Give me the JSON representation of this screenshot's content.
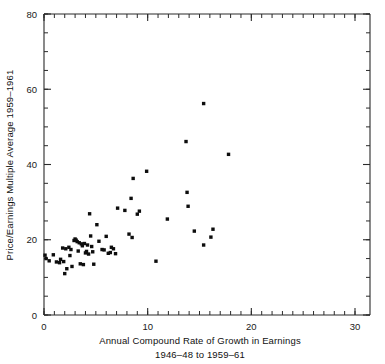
{
  "chart_data": {
    "type": "scatter",
    "title": "",
    "xlabel": "Annual Compound Rate of Growth in Earnings 1946-48 to 1959-61",
    "xlabel_line1": "Annual Compound Rate of Growth in Earnings",
    "xlabel_line2": "1946–48 to 1959–61",
    "ylabel": "Price/Earnings Multiple Average 1959–1961",
    "xlim": [
      0,
      30
    ],
    "ylim": [
      0,
      80
    ],
    "x_ticks": [
      0,
      10,
      20,
      30
    ],
    "y_ticks": [
      0,
      20,
      40,
      60,
      80
    ],
    "x_tick_labels": [
      "0",
      "10",
      "20",
      "30"
    ],
    "y_tick_labels": [
      "0",
      "20",
      "40",
      "60",
      "80"
    ],
    "x_minor_tick_step": 1,
    "y_minor_tick_step": 5,
    "grid": false,
    "legend": false,
    "marker": "filled-square",
    "marker_color": "#0d0d0d",
    "marker_size_px": 3.4,
    "n_points": 66,
    "points": [
      {
        "x": 0.1,
        "y": 15.9
      },
      {
        "x": 0.2,
        "y": 15.0
      },
      {
        "x": 0.5,
        "y": 14.4
      },
      {
        "x": 0.9,
        "y": 16.0
      },
      {
        "x": 1.2,
        "y": 14.1
      },
      {
        "x": 1.5,
        "y": 13.9
      },
      {
        "x": 1.6,
        "y": 14.8
      },
      {
        "x": 1.8,
        "y": 17.8
      },
      {
        "x": 1.9,
        "y": 14.2
      },
      {
        "x": 2.0,
        "y": 11.0
      },
      {
        "x": 2.1,
        "y": 17.6
      },
      {
        "x": 2.2,
        "y": 12.3
      },
      {
        "x": 2.4,
        "y": 18.0
      },
      {
        "x": 2.5,
        "y": 15.8
      },
      {
        "x": 2.6,
        "y": 17.4
      },
      {
        "x": 2.7,
        "y": 12.9
      },
      {
        "x": 2.9,
        "y": 19.8
      },
      {
        "x": 3.0,
        "y": 20.2
      },
      {
        "x": 3.1,
        "y": 19.9
      },
      {
        "x": 3.2,
        "y": 19.5
      },
      {
        "x": 3.3,
        "y": 17.0
      },
      {
        "x": 3.4,
        "y": 19.2
      },
      {
        "x": 3.5,
        "y": 13.6
      },
      {
        "x": 3.6,
        "y": 18.9
      },
      {
        "x": 3.7,
        "y": 18.4
      },
      {
        "x": 3.8,
        "y": 13.4
      },
      {
        "x": 3.9,
        "y": 19.0
      },
      {
        "x": 4.0,
        "y": 16.5
      },
      {
        "x": 4.1,
        "y": 16.9
      },
      {
        "x": 4.2,
        "y": 18.6
      },
      {
        "x": 4.3,
        "y": 16.2
      },
      {
        "x": 4.4,
        "y": 26.9
      },
      {
        "x": 4.5,
        "y": 21.0
      },
      {
        "x": 4.6,
        "y": 18.2
      },
      {
        "x": 4.7,
        "y": 16.8
      },
      {
        "x": 4.8,
        "y": 13.5
      },
      {
        "x": 5.1,
        "y": 24.0
      },
      {
        "x": 5.3,
        "y": 19.6
      },
      {
        "x": 5.6,
        "y": 17.4
      },
      {
        "x": 5.8,
        "y": 17.3
      },
      {
        "x": 6.0,
        "y": 20.9
      },
      {
        "x": 6.2,
        "y": 16.4
      },
      {
        "x": 6.4,
        "y": 16.6
      },
      {
        "x": 6.5,
        "y": 18.0
      },
      {
        "x": 6.7,
        "y": 17.6
      },
      {
        "x": 6.9,
        "y": 16.3
      },
      {
        "x": 7.1,
        "y": 28.4
      },
      {
        "x": 7.8,
        "y": 27.8
      },
      {
        "x": 8.2,
        "y": 21.5
      },
      {
        "x": 8.4,
        "y": 31.0
      },
      {
        "x": 8.5,
        "y": 20.6
      },
      {
        "x": 8.6,
        "y": 36.3
      },
      {
        "x": 9.0,
        "y": 26.8
      },
      {
        "x": 9.2,
        "y": 27.6
      },
      {
        "x": 9.9,
        "y": 38.2
      },
      {
        "x": 10.8,
        "y": 14.3
      },
      {
        "x": 11.9,
        "y": 25.5
      },
      {
        "x": 13.7,
        "y": 46.1
      },
      {
        "x": 13.8,
        "y": 32.6
      },
      {
        "x": 13.9,
        "y": 28.9
      },
      {
        "x": 14.5,
        "y": 22.3
      },
      {
        "x": 15.4,
        "y": 56.2
      },
      {
        "x": 15.4,
        "y": 18.6
      },
      {
        "x": 16.1,
        "y": 20.7
      },
      {
        "x": 16.3,
        "y": 22.8
      },
      {
        "x": 17.8,
        "y": 42.7
      }
    ]
  }
}
